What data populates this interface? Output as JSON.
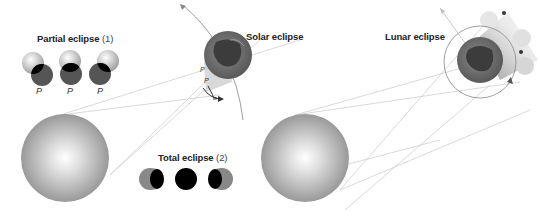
{
  "labels": {
    "partial_title": "Partial eclipse",
    "partial_num": "(1)",
    "total_title": "Total eclipse",
    "total_num": "(2)",
    "solar": "Solar eclipse",
    "lunar": "Lunar eclipse",
    "p": "P"
  },
  "colors": {
    "background": "#ffffff",
    "sun_edge": "#9a9a9a",
    "sun_center": "#ffffff",
    "earth_ocean": "#6f6f6f",
    "earth_land": "#3c3c3c",
    "moon_shadow": "#000000",
    "line": "#c8c8c8"
  },
  "partial_eclipse_phases": [
    "P",
    "P",
    "P"
  ],
  "total_eclipse_phases": [
    "left-crescent",
    "full",
    "right-crescent"
  ]
}
